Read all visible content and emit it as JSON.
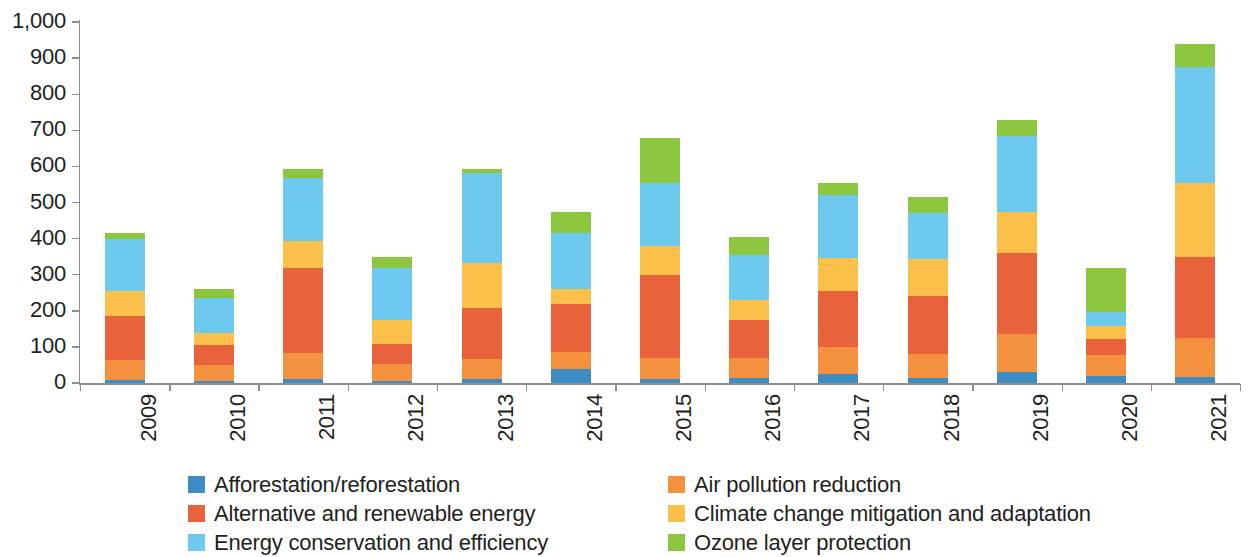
{
  "chart_data": {
    "type": "bar",
    "stacked": true,
    "title": "",
    "subtitle": "",
    "xlabel": "",
    "ylabel": "",
    "grid": false,
    "legend_position": "bottom",
    "ylim": [
      0,
      1000
    ],
    "ytick_labels": [
      "1,000",
      "900",
      "800",
      "700",
      "600",
      "500",
      "400",
      "300",
      "200",
      "100",
      "0"
    ],
    "ytick_values": [
      1000,
      900,
      800,
      700,
      600,
      500,
      400,
      300,
      200,
      100,
      0
    ],
    "categories": [
      "2009",
      "2010",
      "2011",
      "2012",
      "2013",
      "2014",
      "2015",
      "2016",
      "2017",
      "2018",
      "2019",
      "2020",
      "2021"
    ],
    "series": [
      {
        "name": "Afforestation/reforestation",
        "color": "#3d8dc4",
        "values": [
          8,
          6,
          12,
          6,
          10,
          40,
          10,
          14,
          25,
          14,
          30,
          20,
          18
        ]
      },
      {
        "name": "Air pollution reduction",
        "color": "#f4913e",
        "values": [
          57,
          44,
          72,
          48,
          57,
          45,
          60,
          56,
          75,
          66,
          105,
          58,
          107
        ]
      },
      {
        "name": "Alternative and renewable energy",
        "color": "#e8623c",
        "values": [
          120,
          55,
          235,
          55,
          140,
          135,
          230,
          105,
          155,
          160,
          225,
          45,
          225
        ]
      },
      {
        "name": "Climate change mitigation and adaptation",
        "color": "#fbc04a",
        "values": [
          70,
          35,
          75,
          65,
          125,
          40,
          80,
          55,
          90,
          105,
          115,
          35,
          205
        ]
      },
      {
        "name": "Energy conservation and efficiency",
        "color": "#6ec9ef",
        "values": [
          145,
          95,
          175,
          145,
          250,
          155,
          175,
          125,
          175,
          125,
          210,
          40,
          320
        ]
      },
      {
        "name": "Ozone layer protection",
        "color": "#8cc63f",
        "values": [
          15,
          25,
          25,
          30,
          10,
          60,
          125,
          50,
          35,
          45,
          45,
          120,
          65
        ]
      }
    ],
    "totals": [
      415,
      260,
      594,
      349,
      592,
      475,
      680,
      405,
      555,
      515,
      730,
      318,
      940
    ]
  },
  "legend": {
    "items": [
      {
        "label": "Afforestation/reforestation",
        "color": "#3d8dc4",
        "icon": "legend-swatch-icon"
      },
      {
        "label": "Air pollution reduction",
        "color": "#f4913e",
        "icon": "legend-swatch-icon"
      },
      {
        "label": "Alternative and renewable energy",
        "color": "#e8623c",
        "icon": "legend-swatch-icon"
      },
      {
        "label": "Climate change mitigation and adaptation",
        "color": "#fbc04a",
        "icon": "legend-swatch-icon"
      },
      {
        "label": "Energy conservation and efficiency",
        "color": "#6ec9ef",
        "icon": "legend-swatch-icon"
      },
      {
        "label": "Ozone layer protection",
        "color": "#8cc63f",
        "icon": "legend-swatch-icon"
      }
    ],
    "order": [
      0,
      1,
      2,
      3,
      4,
      5
    ]
  },
  "colors": {
    "axis": "#8a8f94",
    "text": "#231f20",
    "background": "#ffffff"
  }
}
